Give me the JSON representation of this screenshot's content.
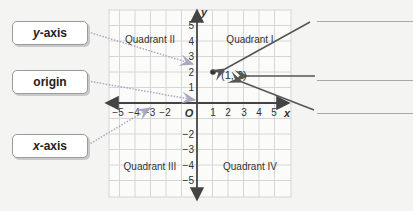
{
  "labels": {
    "y_axis": {
      "italic": "y",
      "rest": "-axis"
    },
    "origin": "origin",
    "x_axis": {
      "italic": "x",
      "rest": "-axis"
    }
  },
  "axes": {
    "x_label": "x",
    "y_label": "y",
    "origin_label": "O",
    "x_ticks": [
      "−5",
      "−4",
      "−3",
      "−2",
      "1",
      "2",
      "3",
      "4",
      "5"
    ],
    "y_ticks": [
      "5",
      "4",
      "3",
      "2",
      "1",
      "−2",
      "−3",
      "−4",
      "−5"
    ]
  },
  "quadrants": {
    "q1": "Quadrant I",
    "q2": "Quadrant II",
    "q3": "Quadrant III",
    "q4": "Quadrant IV"
  },
  "point": {
    "label": "(1, 2)",
    "x": 1,
    "y": 2
  },
  "answer_lines": 3,
  "colors": {
    "grid": "#d2d2d2",
    "axis": "#444444",
    "dotted_arrow": "#9a9ab8",
    "arrow": "#555555",
    "box_border": "#9a9a9a"
  }
}
